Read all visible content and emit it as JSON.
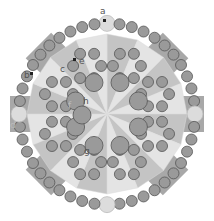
{
  "diagram": {
    "labels": [
      {
        "id": "a",
        "text": "a"
      },
      {
        "id": "b",
        "text": "b"
      },
      {
        "id": "c",
        "text": "c"
      },
      {
        "id": "d",
        "text": "d"
      },
      {
        "id": "e",
        "text": "e"
      },
      {
        "id": "f",
        "text": "f"
      },
      {
        "id": "g",
        "text": "g"
      },
      {
        "id": "h",
        "text": "h"
      }
    ],
    "colors": {
      "bead_fill": "#9a9a9a",
      "bead_stroke": "#555555",
      "light_bead": "#dcdcdc",
      "tab": "#a8a8a8",
      "octagon_light": "#e4e4e4",
      "octagon_dark": "#c4c4c4"
    }
  }
}
